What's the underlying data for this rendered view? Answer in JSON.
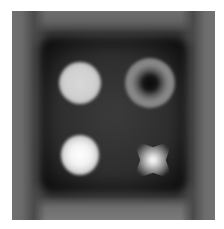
{
  "image": {
    "description": "Grayscale phantom image: square container with gradient border containing four objects",
    "colors": {
      "background": "#ffffff",
      "frame": "#6e6e6e",
      "interior": "#1a1a1a",
      "object_light": "#d8d8d8",
      "object_bright": "#ffffff",
      "ring": "#858585",
      "ring_hole": "#0a0a0a"
    },
    "objects": [
      {
        "name": "filled-disc",
        "position": "top-left"
      },
      {
        "name": "ring",
        "position": "top-right"
      },
      {
        "name": "bright-disc",
        "position": "bottom-left"
      },
      {
        "name": "star-blob",
        "position": "bottom-right"
      }
    ]
  }
}
